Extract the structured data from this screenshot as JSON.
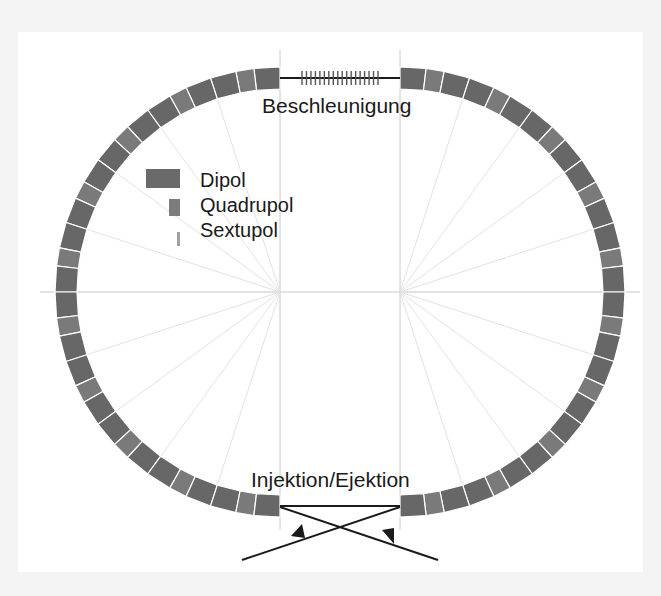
{
  "diagram": {
    "type": "storage-ring-layout",
    "labels": {
      "top": "Beschleunigung",
      "bottom": "Injektion/Ejektion"
    },
    "legend": [
      {
        "label": "Dipol",
        "symbol": "dipole",
        "color": "#6a6a6a"
      },
      {
        "label": "Quadrupol",
        "symbol": "quadrupole",
        "color": "#7c7c7c"
      },
      {
        "label": "Sextupol",
        "symbol": "sextupole",
        "color": "#a0a0a0"
      }
    ],
    "colors": {
      "dipole": "#676767",
      "quadrupole": "#7a7a7a",
      "guide_line": "#c8c8c8",
      "beam_line": "#1a1a1a",
      "background": "#ffffff"
    },
    "geometry": {
      "left_center": [
        280,
        292
      ],
      "right_center": [
        400,
        292
      ],
      "inner_radius": 203,
      "outer_radius": 225,
      "cells_per_arc": 10,
      "cavity_cell_count": 18
    },
    "sections": [
      {
        "name": "accelerating-section",
        "position": "top"
      },
      {
        "name": "injection-extraction-section",
        "position": "bottom"
      }
    ]
  }
}
